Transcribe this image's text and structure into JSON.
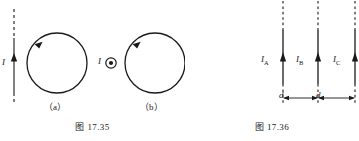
{
  "figures": [
    {
      "id": "fig-17-35",
      "caption": "图 17.35",
      "panels": [
        {
          "key": "a",
          "sublabel": "（a）",
          "current_label": "I",
          "current_direction_icon": "up-arrow-icon",
          "description_parts": [
            "dashed-vertical-wire",
            "arrow-up",
            "circular-loop-ccw"
          ]
        },
        {
          "key": "b",
          "sublabel": "（b）",
          "current_label": "I",
          "current_direction_icon": "dot-out-of-page-icon",
          "description_parts": [
            "dot-out-of-page",
            "circular-loop-ccw"
          ]
        }
      ]
    },
    {
      "id": "fig-17-36",
      "caption": "图 17.36",
      "wires": [
        {
          "label": "I",
          "sub": "A"
        },
        {
          "label": "I",
          "sub": "B"
        },
        {
          "label": "I",
          "sub": "C"
        }
      ],
      "spacings": [
        {
          "label": "d"
        },
        {
          "label": "d"
        }
      ]
    }
  ],
  "colors": {
    "ink": "#1a1a1a",
    "background": "#ffffff"
  }
}
